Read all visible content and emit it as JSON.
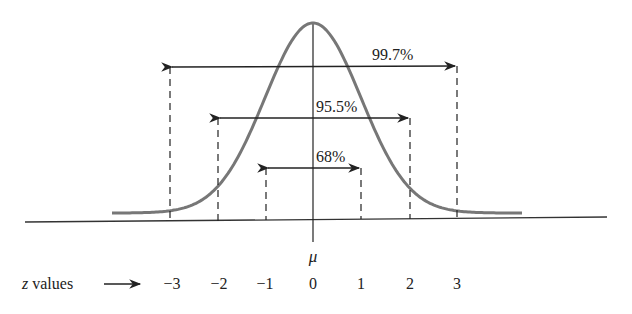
{
  "figure": {
    "mean_symbol": "μ",
    "axis_label": "z values",
    "axis_arrow": "→",
    "curve_color": "#777777",
    "line_color": "#222222"
  },
  "chart_data": {
    "type": "line",
    "title": "",
    "xlabel": "z values",
    "ylabel": "",
    "x_ticks": [
      "-3",
      "-2",
      "-1",
      "0",
      "1",
      "2",
      "3"
    ],
    "center_label": "μ",
    "intervals": [
      {
        "label": "68%",
        "from": -1,
        "to": 1
      },
      {
        "label": "95.5%",
        "from": -2,
        "to": 2
      },
      {
        "label": "99.7%",
        "from": -3,
        "to": 3
      }
    ],
    "grid": false,
    "legend": "none"
  },
  "ticks": [
    {
      "label": "−3",
      "z": -3
    },
    {
      "label": "−2",
      "z": -2
    },
    {
      "label": "−1",
      "z": -1
    },
    {
      "label": "0",
      "z": 0
    },
    {
      "label": "1",
      "z": 1
    },
    {
      "label": "2",
      "z": 2
    },
    {
      "label": "3",
      "z": 3
    }
  ],
  "intervals": {
    "i68": "68%",
    "i955": "95.5%",
    "i997": "99.7%"
  }
}
